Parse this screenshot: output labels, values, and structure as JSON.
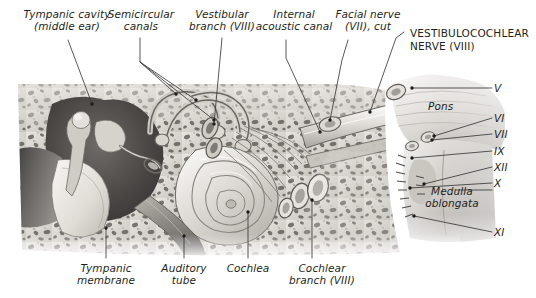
{
  "figure": {
    "background_color": "#ffffff",
    "ink_color": "#231f20",
    "leader_color": "#3a3a3a"
  },
  "labels": {
    "tympanic_cavity": "Tympanic cavity\n(middle ear)",
    "semicircular_canals": "Semicircular\ncanals",
    "vestibular_branch": "Vestibular\nbranch (VIII)",
    "internal_acoustic_canal": "Internal\nacoustic canal",
    "facial_nerve": "Facial nerve\n(VII), cut",
    "vestibulocochlear_nerve": "VESTIBULOCOCHLEAR\nNERVE (VIII)",
    "pons": "Pons",
    "medulla_oblongata": "Medulla\noblongata",
    "tympanic_membrane": "Tympanic\nmembrane",
    "auditory_tube": "Auditory\ntube",
    "cochlea": "Cochlea",
    "cochlear_branch": "Cochlear\nbranch (VIII)"
  },
  "cranial_nerves": [
    {
      "numeral": "V",
      "dash": "–"
    },
    {
      "numeral": "VI",
      "dash": "–"
    },
    {
      "numeral": "VII",
      "dash": "–"
    },
    {
      "numeral": "IX",
      "dash": "–"
    },
    {
      "numeral": "XII",
      "dash": "–"
    },
    {
      "numeral": "X",
      "dash": "–"
    },
    {
      "numeral": "XI",
      "dash": "–"
    }
  ]
}
